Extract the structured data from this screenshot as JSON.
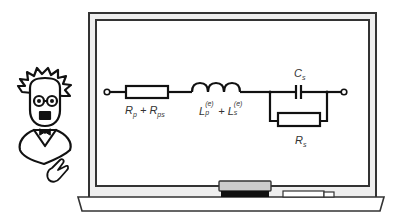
{
  "illustration": {
    "subject": "professor presenting circuit on chalkboard",
    "colors": {
      "stroke": "#111111",
      "frame_fill": "#eeeeee",
      "board_fill": "#ffffff",
      "eraser_top": "#cccccc",
      "eraser_bottom": "#111111"
    }
  },
  "circuit": {
    "elements": [
      {
        "type": "terminal",
        "position": "left"
      },
      {
        "type": "resistor",
        "label_main": "R",
        "label_sub1": "p",
        "label_plus": "+",
        "label_main2": "R",
        "label_sub2": "ps"
      },
      {
        "type": "inductor",
        "label_main": "L",
        "label_sub1": "p",
        "label_sup1": "(e)",
        "label_plus": "+",
        "label_main2": "L",
        "label_sub2": "s",
        "label_sup2": "(e)"
      },
      {
        "type": "capacitor",
        "label_main": "C",
        "label_sub": "s",
        "arrangement": "parallel"
      },
      {
        "type": "resistor",
        "label_main": "R",
        "label_sub": "s",
        "arrangement": "parallel"
      },
      {
        "type": "terminal",
        "position": "right"
      }
    ]
  },
  "labels": {
    "r1_main": "R",
    "r1_sub": "p",
    "plus1": " + ",
    "r1_main2": "R",
    "r1_sub2": "ps",
    "l_main": "L",
    "l_sub": "p",
    "l_sup": "(e)",
    "plus2": " + ",
    "l_main2": "L",
    "l_sub2": "s",
    "l_sup2": "(e)",
    "c_main": "C",
    "c_sub": "s",
    "r2_main": "R",
    "r2_sub": "s"
  }
}
